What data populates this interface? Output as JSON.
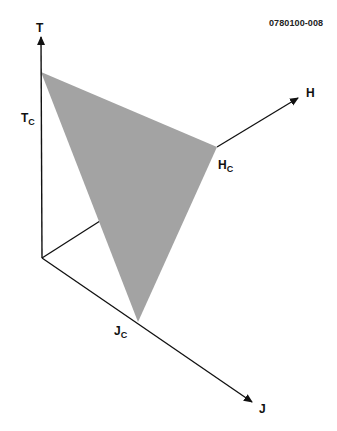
{
  "figure_id": "0780100-008",
  "axes": {
    "t": {
      "label": "T",
      "critical_label": "T",
      "critical_sub": "C"
    },
    "h": {
      "label": "H",
      "critical_label": "H",
      "critical_sub": "C"
    },
    "j": {
      "label": "J",
      "critical_label": "J",
      "critical_sub": "C"
    }
  },
  "colors": {
    "surface_fill": "#a3a3a3",
    "axis_stroke": "#111111",
    "background": "#ffffff"
  },
  "geometry": {
    "origin": [
      42,
      258
    ],
    "t_axis_end": [
      41,
      36
    ],
    "h_axis_end": [
      300,
      97
    ],
    "j_axis_end": [
      254,
      403
    ],
    "triangle": [
      [
        41,
        72
      ],
      [
        217,
        147
      ],
      [
        138,
        322
      ]
    ]
  }
}
